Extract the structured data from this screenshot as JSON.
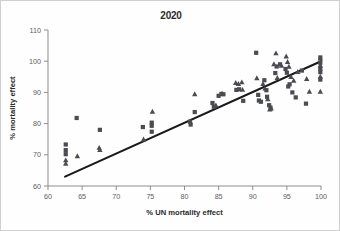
{
  "figure": {
    "title": "2020",
    "background_color": "#fefefe",
    "border_color": "#cfcfcf"
  },
  "chart_data": {
    "type": "scatter",
    "title": "2020",
    "xlabel": "% UN mortality effect",
    "ylabel": "% mortality effect",
    "xlim": [
      60,
      100
    ],
    "ylim": [
      60,
      110
    ],
    "xticks": [
      60,
      65,
      70,
      75,
      80,
      85,
      90,
      95,
      100
    ],
    "yticks": [
      60,
      70,
      80,
      90,
      100,
      110
    ],
    "grid": false,
    "legend": "none",
    "marker_color": "#4b4b52",
    "trendline": {
      "color": "#1a1a1a",
      "x": [
        62.5,
        100.0
      ],
      "y": [
        63.0,
        100.0
      ]
    },
    "series": [
      {
        "name": "square",
        "marker": "square",
        "points": [
          [
            62.6,
            73.3
          ],
          [
            62.6,
            71.5
          ],
          [
            62.6,
            70.2
          ],
          [
            64.2,
            81.8
          ],
          [
            67.6,
            78.0
          ],
          [
            73.9,
            78.9
          ],
          [
            75.2,
            80.3
          ],
          [
            75.2,
            79.3
          ],
          [
            75.2,
            77.4
          ],
          [
            80.8,
            80.6
          ],
          [
            80.9,
            79.7
          ],
          [
            81.5,
            83.7
          ],
          [
            84.1,
            86.6
          ],
          [
            84.3,
            85.4
          ],
          [
            85.0,
            88.9
          ],
          [
            85.4,
            89.5
          ],
          [
            85.7,
            89.4
          ],
          [
            87.6,
            90.8
          ],
          [
            88.0,
            91.0
          ],
          [
            88.6,
            87.3
          ],
          [
            90.5,
            102.7
          ],
          [
            90.8,
            89.2
          ],
          [
            90.9,
            87.4
          ],
          [
            91.2,
            87.0
          ],
          [
            91.7,
            93.9
          ],
          [
            92.0,
            90.7
          ],
          [
            92.1,
            88.6
          ],
          [
            92.4,
            85.9
          ],
          [
            92.6,
            85.1
          ],
          [
            93.3,
            96.2
          ],
          [
            93.5,
            98.3
          ],
          [
            94.0,
            99.0
          ],
          [
            94.8,
            97.5
          ],
          [
            95.0,
            96.3
          ],
          [
            95.2,
            91.9
          ],
          [
            95.4,
            92.6
          ],
          [
            95.8,
            90.0
          ],
          [
            96.3,
            88.4
          ],
          [
            97.2,
            97.0
          ],
          [
            97.8,
            86.4
          ],
          [
            99.9,
            101.2
          ],
          [
            99.9,
            99.5
          ],
          [
            99.9,
            97.6
          ],
          [
            99.9,
            96.5
          ],
          [
            99.9,
            94.1
          ]
        ]
      },
      {
        "name": "triangle",
        "marker": "triangle",
        "points": [
          [
            62.6,
            68.3
          ],
          [
            62.6,
            67.2
          ],
          [
            64.3,
            69.6
          ],
          [
            67.5,
            72.3
          ],
          [
            67.6,
            71.6
          ],
          [
            74.0,
            75.0
          ],
          [
            75.3,
            83.9
          ],
          [
            81.5,
            89.5
          ],
          [
            84.6,
            85.9
          ],
          [
            85.5,
            89.7
          ],
          [
            87.5,
            93.1
          ],
          [
            87.9,
            92.8
          ],
          [
            88.4,
            93.3
          ],
          [
            88.5,
            90.9
          ],
          [
            90.6,
            94.6
          ],
          [
            91.5,
            92.8
          ],
          [
            91.8,
            91.3
          ],
          [
            92.2,
            87.9
          ],
          [
            92.5,
            84.6
          ],
          [
            92.7,
            84.9
          ],
          [
            93.1,
            99.1
          ],
          [
            93.4,
            102.6
          ],
          [
            93.6,
            94.7
          ],
          [
            94.2,
            98.6
          ],
          [
            94.9,
            101.6
          ],
          [
            95.1,
            99.8
          ],
          [
            95.3,
            98.3
          ],
          [
            95.6,
            95.0
          ],
          [
            96.0,
            93.8
          ],
          [
            96.6,
            96.6
          ],
          [
            97.9,
            94.4
          ],
          [
            98.3,
            90.3
          ],
          [
            99.9,
            100.9
          ],
          [
            99.9,
            98.7
          ],
          [
            99.9,
            95.1
          ],
          [
            99.9,
            90.3
          ]
        ]
      }
    ]
  }
}
